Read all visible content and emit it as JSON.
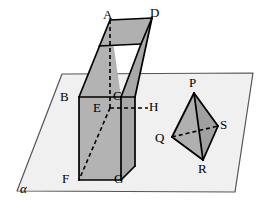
{
  "figure": {
    "width": 270,
    "height": 210,
    "background_color": "#ffffff"
  },
  "plane": {
    "name": "alpha",
    "label": "α",
    "label_x": 20,
    "label_y": 182,
    "fill_color": "#f0f0f0",
    "stroke_color": "#555555",
    "points": "62,74 253,73 235,192 17,191"
  },
  "prism": {
    "description": "Rectangular prism piercing the plane",
    "fill_top": "#b0b0b0",
    "fill_front": "#b3b3b3",
    "fill_side": "#a8a8a8",
    "stroke_color": "#000000",
    "faces": {
      "top": "110,20 152,18 141,44 99,46",
      "upper_front": "79,97 110,20 121,97",
      "upper_left": "79,97 110,20 99,46",
      "upper_right": "121,97 141,44 152,18 135,97",
      "lower_front": "79,97 121,97 121,180 79,180",
      "lower_right": "121,97 135,97 135,166 121,180"
    },
    "vertices": [
      {
        "id": "A",
        "label": "A",
        "x": 110,
        "y": 20,
        "label_x": 103,
        "label_y": 8
      },
      {
        "id": "D",
        "label": "D",
        "x": 152,
        "y": 18,
        "label_x": 150,
        "label_y": 6
      },
      {
        "id": "B",
        "label": "B",
        "x": 79,
        "y": 97,
        "label_x": 60,
        "label_y": 90
      },
      {
        "id": "C",
        "label": "C",
        "x": 121,
        "y": 97,
        "label_x": 113,
        "label_y": 89
      },
      {
        "id": "E",
        "label": "E",
        "x": 110,
        "y": 108,
        "label_x": 93,
        "label_y": 101
      },
      {
        "id": "H",
        "label": "H",
        "x": 148,
        "y": 108,
        "label_x": 149,
        "label_y": 100
      },
      {
        "id": "F",
        "label": "F",
        "x": 79,
        "y": 180,
        "label_x": 62,
        "label_y": 172
      },
      {
        "id": "G",
        "label": "G",
        "x": 121,
        "y": 180,
        "label_x": 114,
        "label_y": 172
      }
    ],
    "solid_edges": [
      {
        "from": "A",
        "to": "D",
        "d": "M110,20 L152,18"
      },
      {
        "from": "A",
        "to": "B",
        "d": "M110,20 L79,97"
      },
      {
        "from": "D",
        "to": "H-lower",
        "d": "M152,18 L135,97"
      },
      {
        "from": "A-inner",
        "to": "C",
        "d": "M141,44 L121,97"
      },
      {
        "from": "D-back",
        "to": "A-back",
        "d": "M152,18 L141,44"
      },
      {
        "from": "top-back-left",
        "to": "A-back",
        "d": "M99,46 L141,44"
      },
      {
        "from": "B",
        "to": "C",
        "d": "M79,97 L121,97"
      },
      {
        "from": "C",
        "to": "H-outer",
        "d": "M121,97 L135,97"
      },
      {
        "from": "B",
        "to": "F",
        "d": "M79,97 L79,180"
      },
      {
        "from": "C",
        "to": "G",
        "d": "M121,97 L121,180"
      },
      {
        "from": "F",
        "to": "G",
        "d": "M79,180 L121,180"
      },
      {
        "from": "G",
        "to": "H-lower",
        "d": "M121,180 L135,166"
      },
      {
        "from": "H-outer",
        "to": "H-lower",
        "d": "M135,97 L135,166"
      }
    ],
    "dashed_edges": [
      {
        "from": "A",
        "to": "E",
        "d": "M110,20 L110,108"
      },
      {
        "from": "E",
        "to": "H",
        "d": "M110,108 L148,108"
      },
      {
        "from": "E",
        "to": "F",
        "d": "M110,108 L79,180"
      },
      {
        "from": "C",
        "to": "E",
        "d": "M121,97 L110,108"
      }
    ]
  },
  "tetrahedron": {
    "description": "Tetrahedron PQRS resting on plane alpha",
    "fill_left": "#b0b0b0",
    "fill_right": "#a0a0a0",
    "stroke_color": "#000000",
    "faces": {
      "left": "194,93 172,137 203,160",
      "right": "194,93 203,160 218,126"
    },
    "vertices": [
      {
        "id": "P",
        "label": "P",
        "x": 194,
        "y": 93,
        "label_x": 189,
        "label_y": 76
      },
      {
        "id": "Q",
        "label": "Q",
        "x": 172,
        "y": 137,
        "label_x": 155,
        "label_y": 131
      },
      {
        "id": "S",
        "label": "S",
        "x": 218,
        "y": 126,
        "label_x": 220,
        "label_y": 118
      },
      {
        "id": "R",
        "label": "R",
        "x": 203,
        "y": 160,
        "label_x": 198,
        "label_y": 162
      }
    ],
    "solid_edges": [
      {
        "from": "P",
        "to": "Q",
        "d": "M194,93 L172,137"
      },
      {
        "from": "P",
        "to": "R",
        "d": "M194,93 L203,160"
      },
      {
        "from": "P",
        "to": "S",
        "d": "M194,93 L218,126"
      },
      {
        "from": "Q",
        "to": "R",
        "d": "M172,137 L203,160"
      },
      {
        "from": "R",
        "to": "S",
        "d": "M203,160 L218,126"
      }
    ],
    "dashed_edges": [
      {
        "from": "Q",
        "to": "S",
        "d": "M172,137 L218,126"
      }
    ]
  }
}
